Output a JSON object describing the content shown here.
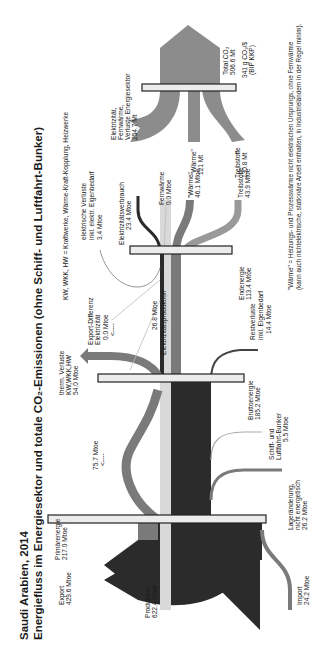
{
  "title": {
    "line1": "Saudi Arabien, 2014",
    "line2": "Energiefluss im Energiesektor und totale CO₂-Emissionen (ohne Schiff- und Luftfahrt-Bunker)"
  },
  "abbrev_note": "KW, WKK, HW  = Kraftwerke, Wärme-Kraft-Kopplung, Heizwerke",
  "footnote": {
    "line1": "\"Wärme\" = Heizungs- und Prozesswärme nicht elektrischen Ursprungs, ohne Fernwärme",
    "line2": "(kann auch nichtelektrische, stationäre Arbeit enthalten, in Industrieländern in der Regel minim)."
  },
  "colors": {
    "dark": "#2b2b2b",
    "mid": "#7a7a7a",
    "light": "#d9d9d9",
    "co2": "#8c8c8c",
    "bar_fill": "#ececec"
  },
  "nodes": {
    "export": {
      "l1": "Export",
      "l2": "429.6 Mtoe"
    },
    "primaerenergie": {
      "l1": "Primärenergie",
      "l2": "217.0 Mtoe"
    },
    "produktion": {
      "l1": "Produktion",
      "l2": "622.4 Mtoe"
    },
    "import": {
      "l1": "Import",
      "l2": "24.2 Mtoe"
    },
    "lageraenderung": {
      "l1": "Lageränderung,",
      "l2": "nicht energetisch",
      "l3": "26.2 Mtoe"
    },
    "bunker": {
      "l1": "Schiff- und",
      "l2": "Luftfahrt-Bunker",
      "l3": "5.5 Mtoe"
    },
    "bruttoenergie": {
      "l1": "Bruttoenergie",
      "l2": "185.2 Mtoe"
    },
    "loop": {
      "l1": "75.7 Mtoe",
      "l2": "<----"
    },
    "therm_verluste": {
      "l1": "therm. Verluste",
      "l2": "KW,WKK,HW",
      "l3": "54.0 Mtoe"
    },
    "export_diff": {
      "l1": "Export-Differenz",
      "l2": "Elektrizität",
      "l3": "0.0 Mtoe",
      "l4": "<----"
    },
    "elektrizitaetsproduktion": {
      "l1": "26.8 Mtoe",
      "l2": "Elektrizitätsproduktion"
    },
    "restverluste": {
      "l1": "Restverluste",
      "l2": "inkl. Eigenbedarf",
      "l3": "14.4 Mtoe"
    },
    "endenergie": {
      "l1": "Endenergie",
      "l2": "113.4 Mtoe"
    },
    "elektr_verluste": {
      "l1": "elektrische Verluste",
      "l2": "inkl. elektr. Eigenbedarf",
      "l3": "3.4 Mtoe"
    },
    "elektrizitaetsverbrauch": {
      "l1": "Elektrizitätsverbrauch",
      "l2": "23.4 Mtoe"
    },
    "fernwaerme": {
      "l1": "Fernwärme",
      "l2": "0.0 Mtoe"
    },
    "waerme": {
      "l1": "\"Wärme\"",
      "l2": "46.1 Mtoe"
    },
    "treibstoffe": {
      "l1": "Treibstoffe",
      "l2": "43.9 Mtoe"
    },
    "co2_elektr": {
      "l1": "Elektrizität,",
      "l2": "Fernwärme,",
      "l3": "Verluste Energiesektor",
      "l4": "254.7 Mt"
    },
    "co2_waerme": {
      "l1": "\"Wärme\"",
      "l2": "121 Mt"
    },
    "co2_treibstoffe": {
      "l1": "Treibstoffe",
      "l2": "130.8 Mt"
    },
    "co2_total": {
      "l1": "Total CO₂",
      "l2": "506.6 Mt",
      "l3": "341 g CO₂/$",
      "l4": "(BIP KKP)"
    }
  }
}
